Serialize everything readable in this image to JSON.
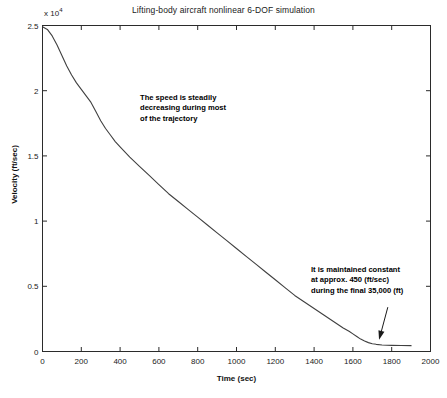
{
  "chart_data": {
    "type": "line",
    "title": "Lifting-body aircraft nonlinear 6-DOF simulation",
    "xlabel": "Time (sec)",
    "ylabel": "Velocity (ft/sec)",
    "y_exponent_label": "x 10",
    "y_exponent_power": "4",
    "y_multiplier": 10000,
    "xlim": [
      0,
      2000
    ],
    "ylim": [
      0,
      25000
    ],
    "xticks": [
      0,
      200,
      400,
      600,
      800,
      1000,
      1200,
      1400,
      1600,
      1800,
      2000
    ],
    "xticklabels": [
      "0",
      "200",
      "400",
      "600",
      "800",
      "1000",
      "1200",
      "1400",
      "1600",
      "1800",
      "2000"
    ],
    "yticks": [
      0,
      5000,
      10000,
      15000,
      20000,
      25000
    ],
    "yticklabels": [
      "0",
      "0.5",
      "1",
      "1.5",
      "2",
      "2.5"
    ],
    "grid": false,
    "legend": null,
    "line_color": "#404040",
    "line_width": 1.1,
    "series": [
      {
        "name": "Velocity",
        "x": [
          0,
          25,
          50,
          75,
          100,
          125,
          150,
          175,
          200,
          225,
          250,
          275,
          300,
          325,
          350,
          375,
          400,
          450,
          500,
          550,
          600,
          650,
          700,
          750,
          800,
          850,
          900,
          950,
          1000,
          1050,
          1100,
          1150,
          1200,
          1250,
          1300,
          1350,
          1400,
          1450,
          1500,
          1550,
          1580,
          1600,
          1620,
          1640,
          1660,
          1680,
          1700,
          1720,
          1750,
          1800,
          1850,
          1900
        ],
        "y": [
          24900,
          24700,
          24200,
          23500,
          22700,
          21900,
          21200,
          20600,
          20100,
          19600,
          19100,
          18400,
          17700,
          17100,
          16600,
          16100,
          15700,
          14900,
          14200,
          13500,
          12800,
          12100,
          11500,
          10900,
          10300,
          9700,
          9100,
          8500,
          7900,
          7300,
          6700,
          6100,
          5500,
          4900,
          4300,
          3800,
          3300,
          2800,
          2300,
          1800,
          1550,
          1350,
          1150,
          950,
          800,
          680,
          600,
          550,
          500,
          470,
          455,
          450
        ]
      }
    ],
    "annotations": [
      {
        "name": "speed-decreasing",
        "lines": [
          "The speed is steadily",
          "decreasing during most",
          "of the trajectory"
        ]
      },
      {
        "name": "constant-speed",
        "lines": [
          "It is maintained constant",
          "at approx. 450 (ft/sec)",
          "during the final 35,000 (ft)"
        ],
        "arrow": {
          "from_x": 1780,
          "from_y": 3400,
          "to_x": 1735,
          "to_y": 900
        }
      }
    ]
  }
}
